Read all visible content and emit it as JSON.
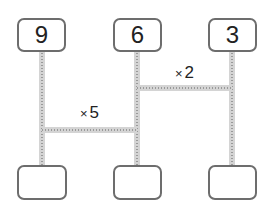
{
  "diagram": {
    "type": "amidakuji-ladder",
    "top_boxes": [
      {
        "value": "9"
      },
      {
        "value": "6"
      },
      {
        "value": "3"
      }
    ],
    "bottom_boxes": [
      {
        "value": ""
      },
      {
        "value": ""
      },
      {
        "value": ""
      }
    ],
    "rungs": [
      {
        "from_column": 2,
        "to_column": 3,
        "symbol": "×",
        "operand": "2"
      },
      {
        "from_column": 1,
        "to_column": 2,
        "symbol": "×",
        "operand": "5"
      }
    ],
    "colors": {
      "box_border": "#6d6d6d",
      "line_fill": "#d4d4d4",
      "line_dots": "#9a9a9a",
      "text": "#222222"
    }
  }
}
